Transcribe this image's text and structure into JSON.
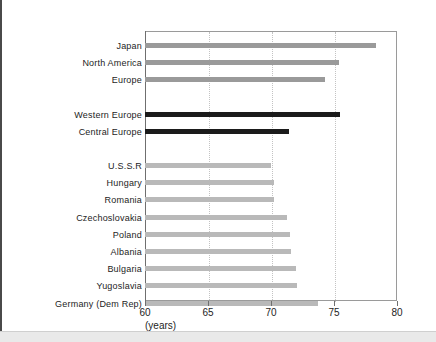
{
  "chart_data": {
    "type": "bar",
    "orientation": "horizontal",
    "title": "",
    "xlabel": "(years)",
    "ylabel": "",
    "xlim": [
      60,
      80
    ],
    "xticks": [
      60,
      65,
      70,
      75,
      80
    ],
    "xtick_labels": [
      "60",
      "65",
      "70",
      "75",
      "80"
    ],
    "grid": "vertical-dotted at 65, 70, 75",
    "legend": "none",
    "categories": [
      "Japan",
      "North America",
      "Europe",
      "Western Europe",
      "Central Europe",
      "U.S.S.R",
      "Hungary",
      "Romania",
      "Czechoslovakia",
      "Poland",
      "Albania",
      "Bulgaria",
      "Yugoslavia",
      "Germany (Dem Rep)"
    ],
    "values": [
      78.3,
      75.4,
      74.3,
      75.5,
      71.4,
      70.0,
      70.2,
      70.2,
      71.3,
      71.5,
      71.6,
      72.0,
      72.1,
      73.7
    ],
    "bar_styles": [
      "medium",
      "medium",
      "medium",
      "dark",
      "dark",
      "light",
      "light",
      "light",
      "light",
      "light",
      "light",
      "light",
      "light",
      "light"
    ],
    "group_gaps_after": [
      "Europe",
      "Central Europe"
    ],
    "colors": {
      "bar_medium": "#9a9a9a",
      "bar_dark": "#1b1b1b",
      "bar_light": "#b9b9b9",
      "frame": "#9a9a9a",
      "gridline": "#c3c3c3",
      "text": "#1d1d1d"
    }
  }
}
